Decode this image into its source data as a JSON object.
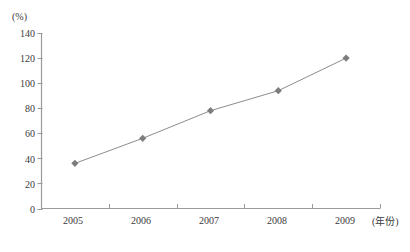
{
  "chart_data": {
    "type": "line",
    "title": "",
    "xlabel": "(年份)",
    "ylabel": "(%)",
    "categories": [
      "2005",
      "2006",
      "2007",
      "2008",
      "2009"
    ],
    "values": [
      36,
      56,
      78,
      94,
      120
    ],
    "series": [
      {
        "name": "",
        "values": [
          36,
          56,
          78,
          94,
          120
        ]
      }
    ],
    "ylim": [
      0,
      140
    ],
    "ytick_labels": [
      "0",
      "20",
      "40",
      "60",
      "80",
      "100",
      "120",
      "140"
    ],
    "ytick_values": [
      0,
      20,
      40,
      60,
      80,
      100,
      120,
      140
    ],
    "grid": false,
    "legend": false,
    "marker": "diamond",
    "colors": {
      "line": "#8c8c8c",
      "marker": "#7d7d7d",
      "axis": "#9a9a9a",
      "text": "#3b3b3b"
    }
  }
}
